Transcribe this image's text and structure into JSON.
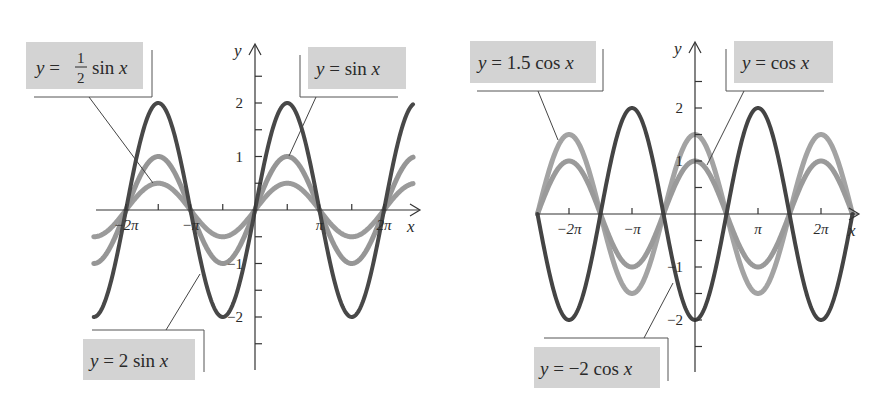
{
  "chart_data": [
    {
      "type": "line",
      "title": "",
      "xlabel": "x",
      "ylabel": "y",
      "xlim_pi": [
        -2.5,
        2.45
      ],
      "ylim": [
        -3,
        3
      ],
      "grid": false,
      "legend_position": "callout labels",
      "x_ticks": [
        {
          "pi": -2,
          "label": "−2π"
        },
        {
          "pi": -1.5,
          "label": ""
        },
        {
          "pi": -1,
          "label": "−π"
        },
        {
          "pi": -0.5,
          "label": ""
        },
        {
          "pi": 0.5,
          "label": ""
        },
        {
          "pi": 1,
          "label": "π"
        },
        {
          "pi": 1.5,
          "label": ""
        },
        {
          "pi": 2,
          "label": "2π"
        }
      ],
      "y_ticks": [
        {
          "v": 2.5,
          "label": ""
        },
        {
          "v": 2,
          "label": "2"
        },
        {
          "v": 1.5,
          "label": ""
        },
        {
          "v": 1,
          "label": "1"
        },
        {
          "v": 0.5,
          "label": ""
        },
        {
          "v": -0.5,
          "label": ""
        },
        {
          "v": -1,
          "label": "−1"
        },
        {
          "v": -1.5,
          "label": ""
        },
        {
          "v": -2,
          "label": "−2"
        },
        {
          "v": -2.5,
          "label": ""
        }
      ],
      "series": [
        {
          "name": "y = ½ sin x",
          "func": "sin",
          "amplitude": 0.5,
          "color": "#9b9b9b",
          "width": 5
        },
        {
          "name": "y = sin x",
          "func": "sin",
          "amplitude": 1,
          "color": "#969696",
          "width": 5
        },
        {
          "name": "y = 2 sin x",
          "func": "sin",
          "amplitude": 2,
          "color": "#484848",
          "width": 4
        }
      ],
      "labels": [
        {
          "id": "half-sin",
          "pre": "y = ",
          "frac": [
            "1",
            "2"
          ],
          "post": " sin ",
          "var": "x"
        },
        {
          "id": "sin",
          "pre": "y = ",
          "post": " sin ",
          "var": "x"
        },
        {
          "id": "two-sin",
          "pre": "y = ",
          "post": " 2  sin ",
          "var": "x"
        }
      ]
    },
    {
      "type": "line",
      "title": "",
      "xlabel": "x",
      "ylabel": "y",
      "xlim_pi": [
        -2.5,
        2.5
      ],
      "ylim": [
        -3,
        3
      ],
      "grid": false,
      "legend_position": "callout labels",
      "x_ticks": [
        {
          "pi": -2,
          "label": "−2π"
        },
        {
          "pi": -1,
          "label": "−π"
        },
        {
          "pi": 1,
          "label": "π"
        },
        {
          "pi": 2,
          "label": "2π"
        }
      ],
      "y_ticks": [
        {
          "v": 2.5,
          "label": ""
        },
        {
          "v": 2,
          "label": "2"
        },
        {
          "v": 1.5,
          "label": ""
        },
        {
          "v": 1,
          "label": "1"
        },
        {
          "v": 0.5,
          "label": ""
        },
        {
          "v": -0.5,
          "label": ""
        },
        {
          "v": -1,
          "label": "−1"
        },
        {
          "v": -1.5,
          "label": ""
        },
        {
          "v": -2,
          "label": "−2"
        },
        {
          "v": -2.5,
          "label": ""
        }
      ],
      "series": [
        {
          "name": "y = 1.5 cos x",
          "func": "cos",
          "amplitude": 1.5,
          "color": "#a3a3a3",
          "width": 5
        },
        {
          "name": "y = cos x",
          "func": "cos",
          "amplitude": 1,
          "color": "#9a9a9a",
          "width": 5
        },
        {
          "name": "y = −2 cos x",
          "func": "cos",
          "amplitude": -2,
          "color": "#444444",
          "width": 4
        }
      ],
      "labels": [
        {
          "id": "one-half-cos",
          "pre": "y = ",
          "post": " 1.5 cos ",
          "var": "x"
        },
        {
          "id": "cos",
          "pre": "y = ",
          "post": " cos ",
          "var": "x"
        },
        {
          "id": "neg-two-cos",
          "pre": "y = ",
          "post": " −2 cos ",
          "var": "x"
        }
      ]
    }
  ]
}
